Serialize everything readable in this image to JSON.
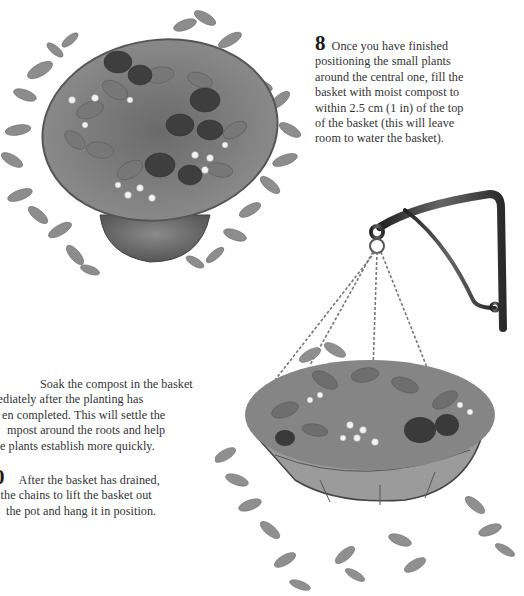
{
  "steps": [
    {
      "number": "8",
      "lines": [
        "Once you have finished",
        "positioning the small plants",
        "around the central one, fill the",
        "basket with moist compost to",
        "within 2.5 cm (1 in) of the top",
        "of the basket (this will leave",
        "room to water the basket)."
      ]
    },
    {
      "number": "",
      "lines": [
        "Soak the compost in the basket",
        "mediately after the planting has",
        "en completed. This will settle the",
        "mpost around the roots and help",
        "e plants establish more quickly."
      ]
    },
    {
      "number": "0",
      "lines": [
        "After the basket has drained,",
        "e the chains to lift the basket out",
        "the pot and hang it in position."
      ]
    }
  ],
  "illustrations": {
    "top_left": "basket-planted-in-pot",
    "right": "hanging-basket-on-wall-bracket"
  },
  "colors": {
    "background": "#ffffff",
    "text": "#333333",
    "foliage_light": "#9a9a9a",
    "foliage_dark": "#4a4a4a",
    "metal": "#3a3a3a"
  }
}
